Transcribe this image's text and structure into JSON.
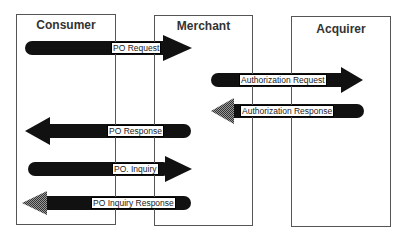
{
  "diagram": {
    "type": "sequence-message-flow",
    "colors": {
      "arrow": "#111111",
      "box_border": "#555555",
      "hatched_head": "#7a7a7a",
      "background": "#ffffff"
    },
    "parties": [
      {
        "id": "consumer",
        "label": "Consumer"
      },
      {
        "id": "merchant",
        "label": "Merchant"
      },
      {
        "id": "acquirer",
        "label": "Acquirer"
      }
    ],
    "messages": [
      {
        "label": "PO  Request",
        "from": "consumer",
        "to": "merchant"
      },
      {
        "label": "Authorization Request",
        "from": "merchant",
        "to": "acquirer"
      },
      {
        "label": "Authorization Response",
        "from": "acquirer",
        "to": "merchant"
      },
      {
        "label": "PO  Response",
        "from": "merchant",
        "to": "consumer"
      },
      {
        "label": "PO. Inquiry",
        "from": "consumer",
        "to": "merchant"
      },
      {
        "label": "PO  Inquiry Response",
        "from": "merchant",
        "to": "consumer"
      }
    ]
  }
}
